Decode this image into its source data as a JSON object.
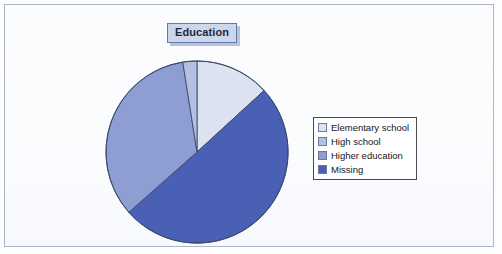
{
  "chart": {
    "title": "Education",
    "legend": {
      "position": "right",
      "entries": [
        {
          "label": "Elementary school",
          "color": "#dde2f0"
        },
        {
          "label": "High school",
          "color": "#b4c0e0"
        },
        {
          "label": "Higher education",
          "color": "#8e9ed2"
        },
        {
          "label": "Missing",
          "color": "#4a60b4"
        }
      ]
    }
  },
  "chart_data": {
    "type": "pie",
    "title": "Education",
    "xlabel": "",
    "ylabel": "",
    "grid": false,
    "legend_position": "right",
    "start_angle_deg": 0,
    "direction": "clockwise",
    "categories": [
      "Elementary school",
      "High school",
      "Higher education",
      "Missing"
    ],
    "values": [
      13.2,
      2.5,
      34.0,
      50.3
    ],
    "units": "percent",
    "colors": [
      "#dde2f0",
      "#b4c0e0",
      "#8e9ed2",
      "#4a60b4"
    ],
    "slice_order_clockwise_from_top": [
      "Elementary school",
      "Missing",
      "Higher education",
      "High school"
    ],
    "slice_angles_deg": {
      "Elementary school": [
        0,
        47.5
      ],
      "Missing": [
        47.5,
        228.5
      ],
      "Higher education": [
        228.5,
        351.0
      ],
      "High school": [
        351.0,
        360.0
      ]
    }
  },
  "style": {
    "slice_outline": "#3c4a6e",
    "frame_border": "#a9b4ce",
    "title_fill": "#ced7ea",
    "title_border": "#5f7bb0",
    "legend_border": "#4a4a4a",
    "background": "#fdfdfe"
  }
}
